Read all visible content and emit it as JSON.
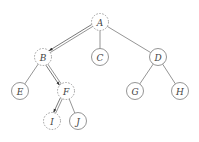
{
  "diagram": {
    "type": "tree",
    "nodes": [
      {
        "id": "A",
        "label": "A",
        "x": 100,
        "y": 22,
        "style": "dashed"
      },
      {
        "id": "B",
        "label": "B",
        "x": 43,
        "y": 57,
        "style": "dashed"
      },
      {
        "id": "C",
        "label": "C",
        "x": 100,
        "y": 57,
        "style": "solid"
      },
      {
        "id": "D",
        "label": "D",
        "x": 158,
        "y": 57,
        "style": "solid"
      },
      {
        "id": "E",
        "label": "E",
        "x": 20,
        "y": 91,
        "style": "solid"
      },
      {
        "id": "F",
        "label": "F",
        "x": 66,
        "y": 91,
        "style": "dashed"
      },
      {
        "id": "G",
        "label": "G",
        "x": 135,
        "y": 91,
        "style": "solid"
      },
      {
        "id": "H",
        "label": "H",
        "x": 180,
        "y": 91,
        "style": "solid"
      },
      {
        "id": "I",
        "label": "I",
        "x": 52,
        "y": 121,
        "style": "dashed"
      },
      {
        "id": "J",
        "label": "J",
        "x": 78,
        "y": 121,
        "style": "solid"
      }
    ],
    "edges": [
      {
        "from": "A",
        "to": "B"
      },
      {
        "from": "A",
        "to": "C"
      },
      {
        "from": "A",
        "to": "D"
      },
      {
        "from": "B",
        "to": "E"
      },
      {
        "from": "B",
        "to": "F"
      },
      {
        "from": "D",
        "to": "G"
      },
      {
        "from": "D",
        "to": "H"
      },
      {
        "from": "F",
        "to": "I"
      },
      {
        "from": "F",
        "to": "J"
      }
    ],
    "path_arrows": [
      {
        "from": "A",
        "to": "B"
      },
      {
        "from": "B",
        "to": "F"
      },
      {
        "from": "F",
        "to": "I"
      }
    ],
    "node_radius": 8.5
  }
}
